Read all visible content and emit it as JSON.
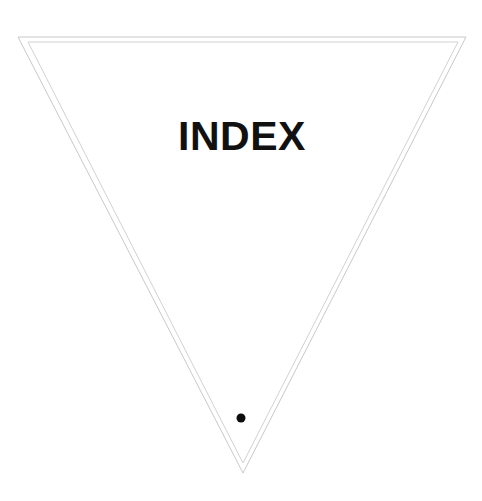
{
  "page": {
    "background_color": "#ffffff",
    "width": 482,
    "height": 501
  },
  "card": {
    "title": "INDEX",
    "title_color": "#111111",
    "shape_name": "inverted-triangle",
    "outline_color": "#c9c9c9",
    "inner_outline_color": "#d2d2d2",
    "outer_triangle": {
      "points": "18,37 466,37 243,473"
    },
    "inner_triangle": {
      "points": "28,42 458,42 243,463"
    },
    "marker": {
      "name": "dot",
      "color": "#0d0d0d",
      "cx": 241,
      "cy": 418,
      "r": 4.5
    }
  }
}
